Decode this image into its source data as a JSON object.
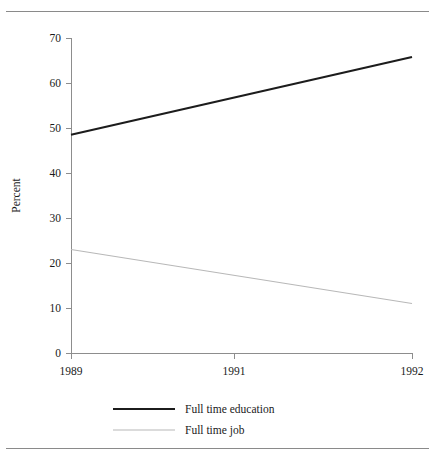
{
  "figure": {
    "top_rule": "horizontal-rule",
    "bottom_rule": "horizontal-rule"
  },
  "chart_data": {
    "type": "line",
    "title": "",
    "subtitle": "",
    "xlabel": "",
    "ylabel": "Percent",
    "x": [
      1989,
      1992
    ],
    "xtick_labels": [
      "1989",
      "1991",
      "1992"
    ],
    "xtick_values": [
      1989,
      1991,
      1992
    ],
    "xlim": [
      1989,
      1992
    ],
    "ylim": [
      0,
      70
    ],
    "ytick_labels": [
      "0",
      "10",
      "20",
      "30",
      "40",
      "50",
      "60",
      "70"
    ],
    "ytick_values": [
      0,
      10,
      20,
      30,
      40,
      50,
      60,
      70
    ],
    "grid": false,
    "legend_position": "below-plot-left",
    "series": [
      {
        "name": "Full time education",
        "color": "#1c1c1c",
        "width": 2.1,
        "points": [
          {
            "x": 1989,
            "y": 48.5
          },
          {
            "x": 1992,
            "y": 65.8
          }
        ]
      },
      {
        "name": "Full time job",
        "color": "#b8b8b8",
        "width": 1.2,
        "points": [
          {
            "x": 1989,
            "y": 23.0
          },
          {
            "x": 1992,
            "y": 11.0
          }
        ]
      }
    ]
  },
  "legend": {
    "entries": [
      {
        "label": "Full time education"
      },
      {
        "label": "Full time job"
      }
    ]
  }
}
